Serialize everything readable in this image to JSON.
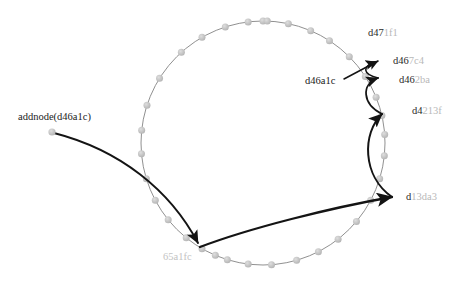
{
  "diagram": {
    "kind": "dht-ring-node-join",
    "title": "addnode(d46a1c)",
    "ring": {
      "center_x": 263,
      "center_y": 143,
      "radius": 122,
      "stroke_color": "#8a8a8a",
      "node_color": "#c6c6c6",
      "node_count": 30
    },
    "arrow_color": "#141414",
    "labels": {
      "addnode": {
        "text": "addnode(d46a1c)",
        "x": 18,
        "y": 112,
        "style": "dark"
      },
      "operation_source": {
        "text": "d46a1c",
        "x": 305,
        "y": 76,
        "style": "dark"
      },
      "n_d471f1": {
        "prefix": "d47",
        "suffix": "1f1",
        "x": 368,
        "y": 28,
        "style": "two-tone"
      },
      "n_d467c4": {
        "prefix": "d46",
        "suffix": "7c4",
        "x": 393,
        "y": 56,
        "style": "two-tone"
      },
      "n_d462ba": {
        "prefix": "d46",
        "suffix": "2ba",
        "x": 399,
        "y": 75,
        "style": "two-tone"
      },
      "n_d4213f": {
        "prefix": "d4",
        "suffix": "213f",
        "x": 412,
        "y": 106,
        "style": "two-tone"
      },
      "n_d13da3": {
        "prefix": "d",
        "suffix": "13da3",
        "x": 406,
        "y": 192,
        "style": "two-tone"
      },
      "n_65a1fc": {
        "prefix": "65a1fc",
        "suffix": "",
        "x": 163,
        "y": 252,
        "style": "all-light"
      }
    },
    "ring_nodes": [
      {
        "name": "ring-node-0",
        "angle_deg": -90.0
      },
      {
        "name": "ring-node-1",
        "angle_deg": -78.0
      },
      {
        "name": "ring-node-2",
        "angle_deg": -67.0
      },
      {
        "name": "ring-node-3",
        "angle_deg": -57.0
      },
      {
        "name": "ring-node-4",
        "angle_deg": -45.0
      },
      {
        "name": "ring-node-5",
        "angle_deg": -33.0
      },
      {
        "name": "ring-node-6",
        "angle_deg": -22.0
      },
      {
        "name": "ring-node-7",
        "angle_deg": -13.0
      },
      {
        "name": "ring-node-8",
        "angle_deg": -4.0
      },
      {
        "name": "ring-node-9",
        "angle_deg": 6.0
      },
      {
        "name": "ring-node-10",
        "angle_deg": 17.0
      },
      {
        "name": "ring-node-11",
        "angle_deg": 28.0
      },
      {
        "name": "ring-node-12",
        "angle_deg": 40.0
      },
      {
        "name": "ring-node-13",
        "angle_deg": 52.0
      },
      {
        "name": "ring-node-14",
        "angle_deg": 63.0
      },
      {
        "name": "ring-node-15",
        "angle_deg": 74.0
      },
      {
        "name": "ring-node-16",
        "angle_deg": 86.0
      },
      {
        "name": "ring-node-17",
        "angle_deg": 97.0
      },
      {
        "name": "ring-node-18",
        "angle_deg": 107.0
      },
      {
        "name": "ring-node-19",
        "angle_deg": 113.0
      },
      {
        "name": "ring-node-20",
        "angle_deg": 120.0
      },
      {
        "name": "ring-node-21",
        "angle_deg": 129.0
      },
      {
        "name": "ring-node-22",
        "angle_deg": 141.0
      },
      {
        "name": "ring-node-23",
        "angle_deg": 152.0
      },
      {
        "name": "ring-node-24",
        "angle_deg": 163.0
      },
      {
        "name": "ring-node-25",
        "angle_deg": 175.0
      },
      {
        "name": "ring-node-26",
        "angle_deg": 186.0
      },
      {
        "name": "ring-node-27",
        "angle_deg": 198.0
      },
      {
        "name": "ring-node-28",
        "angle_deg": 212.0
      },
      {
        "name": "ring-node-29",
        "angle_deg": 228.0
      },
      {
        "name": "ring-node-30",
        "angle_deg": 240.0
      },
      {
        "name": "ring-node-31",
        "angle_deg": 252.0
      },
      {
        "name": "ring-node-32",
        "angle_deg": 263.0
      },
      {
        "name": "ring-node-33",
        "angle_deg": 272.0
      }
    ],
    "arrows": [
      {
        "name": "arrow-addnode-to-65a1fc",
        "path": "M 54 133 C 120 150 170 190 198 243",
        "width": 1.9
      },
      {
        "name": "arrow-65a1fc-to-d13da3",
        "path": "M 200 247 C 250 228 330 208 392 197",
        "width": 2.3
      },
      {
        "name": "arrow-d13da3-to-d4213f",
        "path": "M 392 197 C 362 176 362 133 382 114",
        "width": 2.0
      },
      {
        "name": "arrow-d4213f-to-d462ba",
        "path": "M 382 114 C 362 104 361 84 378 78",
        "width": 1.8
      },
      {
        "name": "arrow-d462ba-to-d467c4",
        "path": "M 378 78 C 362 74 362 66 376 62",
        "width": 1.6
      },
      {
        "name": "arrow-pointer-d46a1c",
        "path": "M 344 79 L 378 61",
        "width": 1.5
      }
    ],
    "source_dot": {
      "name": "addnode-source-dot",
      "x": 52,
      "y": 132,
      "r": 3.6
    }
  }
}
